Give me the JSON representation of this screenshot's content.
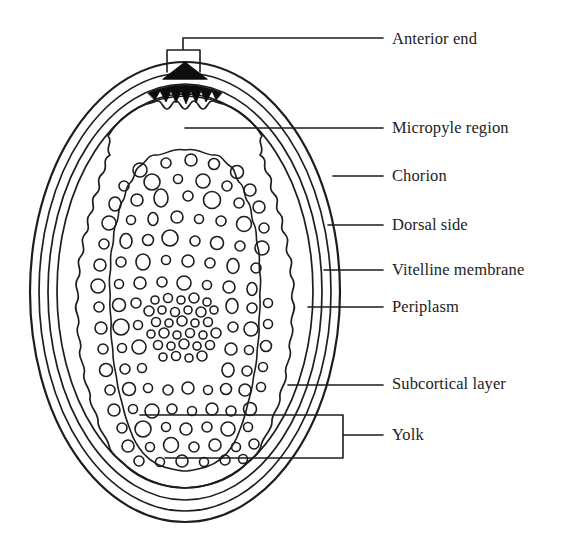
{
  "figure": {
    "background_color": "#ffffff",
    "line_color": "#1d1d1d",
    "fill_color": "#000000"
  },
  "labels": [
    {
      "id": "anterior-end",
      "text": "Anterior end",
      "x": 392,
      "y": 31,
      "connector": "bracket"
    },
    {
      "id": "micropyle-region",
      "text": "Micropyle region",
      "x": 392,
      "y": 120,
      "connector": "line"
    },
    {
      "id": "chorion",
      "text": "Chorion",
      "x": 392,
      "y": 168,
      "connector": "line"
    },
    {
      "id": "dorsal-side",
      "text": "Dorsal side",
      "x": 392,
      "y": 217,
      "connector": "line"
    },
    {
      "id": "vitelline-membrane",
      "text": "Vitelline membrane",
      "x": 392,
      "y": 262,
      "connector": "line"
    },
    {
      "id": "periplasm",
      "text": "Periplasm",
      "x": 392,
      "y": 299,
      "connector": "line"
    },
    {
      "id": "subcortical-layer",
      "text": "Subcortical layer",
      "x": 392,
      "y": 376,
      "connector": "line"
    },
    {
      "id": "yolk",
      "text": "Yolk",
      "x": 392,
      "y": 427,
      "connector": "bracket"
    }
  ],
  "structures": [
    {
      "id": "chorion-outer",
      "name": "Chorion (outer shell)"
    },
    {
      "id": "chorion-inner",
      "name": "Chorion inner boundary"
    },
    {
      "id": "vitelline-membrane",
      "name": "Vitelline membrane"
    },
    {
      "id": "periplasm",
      "name": "Periplasm"
    },
    {
      "id": "subcortical-layer",
      "name": "Subcortical layer"
    },
    {
      "id": "yolk-granules",
      "name": "Yolk granules"
    },
    {
      "id": "micropyle-cap",
      "name": "Micropyle cap"
    },
    {
      "id": "micropyle-teeth",
      "name": "Micropyle region band"
    }
  ],
  "leaders": {
    "anterior_end": {
      "x1": 183,
      "y1": 72,
      "x2": 383,
      "y2": 38
    },
    "micropyle_region": {
      "x1": 185,
      "y1": 128,
      "x2": 383,
      "y2": 128
    },
    "chorion": {
      "x1": 333,
      "y1": 176,
      "x2": 383,
      "y2": 176
    },
    "dorsal_side": {
      "x1": 328,
      "y1": 225,
      "x2": 383,
      "y2": 225
    },
    "vitelline_membrane": {
      "x1": 324,
      "y1": 270,
      "x2": 383,
      "y2": 270
    },
    "periplasm": {
      "x1": 308,
      "y1": 307,
      "x2": 383,
      "y2": 307
    },
    "subcortical_layer": {
      "x1": 288,
      "y1": 385,
      "x2": 383,
      "y2": 385
    },
    "yolk": {
      "x1": 343,
      "y1": 435,
      "x2": 383,
      "y2": 435
    }
  }
}
